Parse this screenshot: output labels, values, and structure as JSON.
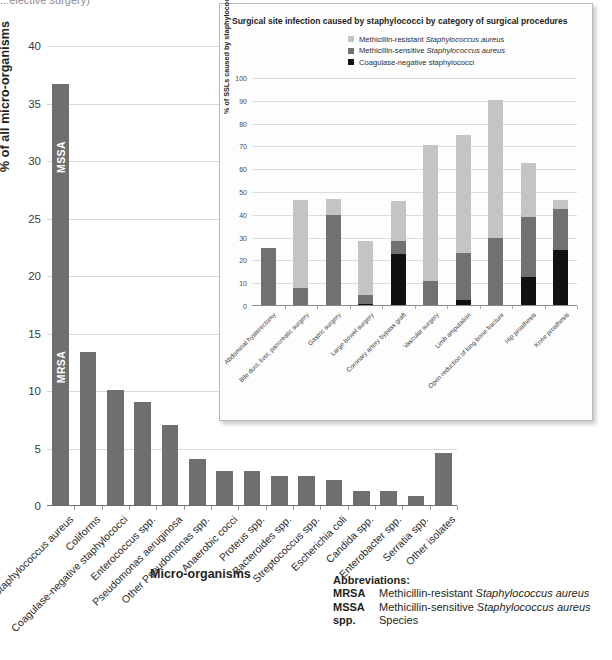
{
  "clipped_caption": "...elective surgery)",
  "main": {
    "ylabel": "% of all micro-organisms",
    "xtitle": "Micro-organisms",
    "yticks": [
      "0",
      "5",
      "10",
      "15",
      "20",
      "25",
      "30",
      "35",
      "40"
    ],
    "segment_labels": {
      "mssa": "MSSA",
      "mrsa": "MRSA"
    },
    "bar_color": "#6f6f6f"
  },
  "inset": {
    "title": "Surgical site infection caused by staphylococci by category of surgical procedures",
    "ylabel": "% of SSLs caused by staphylococci",
    "yticks": [
      "0",
      "10",
      "20",
      "30",
      "40",
      "50",
      "60",
      "70",
      "80",
      "90",
      "100"
    ],
    "legend": [
      {
        "label": "Methicillin-resistant Staphylococcus aureus",
        "plain": "Methicillin-resistant ",
        "italic": "Staphylococcus aureus",
        "color": "#c4c4c4"
      },
      {
        "label": "Methicillin-sensitive Staphylococcus aureus",
        "plain": "Methicillin-sensitive ",
        "italic": "Staphylococcus aureus",
        "color": "#717171"
      },
      {
        "label": "Coagulase-negative staphylococci",
        "plain": "Coagulase-negative staphylococci",
        "italic": "",
        "color": "#111111"
      }
    ]
  },
  "abbreviations": {
    "title": "Abbreviations:",
    "rows": [
      {
        "key": "MRSA",
        "plain": "Methicillin-resistant ",
        "italic": "Staphylococcus aureus"
      },
      {
        "key": "MSSA",
        "plain": "Methicillin-sensitive ",
        "italic": "Staphylococcus aureus"
      },
      {
        "key": "spp.",
        "plain": "Species",
        "italic": ""
      }
    ]
  },
  "chart_data": [
    {
      "type": "bar",
      "id": "main",
      "title": "",
      "xlabel": "Micro-organisms",
      "ylabel": "% of all micro-organisms",
      "ylim": [
        0,
        40
      ],
      "ytick_step": 5,
      "grid": true,
      "legend": "none",
      "bar_color": "#6f6f6f",
      "categories": [
        "Staphylococcus aureus",
        "Coliforms",
        "Coagulase-negative staphylococci",
        "Enterococcus spp.",
        "Pseudomonas aeruginosa",
        "Other Pseudomonas spp.",
        "Anaerobic cocci",
        "Proteus spp.",
        "Bacteroides spp.",
        "Streptococcus spp.",
        "Escherichia coli",
        "Candida spp.",
        "Enterobacter spp.",
        "Serratia spp.",
        "Other isolates"
      ],
      "values": [
        36.6,
        13.3,
        10.0,
        9.0,
        7.0,
        4.0,
        3.0,
        3.0,
        2.5,
        2.5,
        2.2,
        1.2,
        1.2,
        0.8,
        4.5
      ],
      "annotations": [
        {
          "category": "Staphylococcus aureus",
          "label": "MSSA",
          "from": 24.0,
          "to": 36.6
        },
        {
          "category": "Staphylococcus aureus",
          "label": "MRSA",
          "from": 0.0,
          "to": 24.0
        }
      ]
    },
    {
      "type": "bar",
      "id": "inset",
      "stacked": true,
      "title": "Surgical site infection caused by staphylococci by category of surgical procedures",
      "xlabel": "",
      "ylabel": "% of SSLs caused by staphylococci",
      "ylim": [
        0,
        100
      ],
      "ytick_step": 10,
      "grid": true,
      "legend_position": "top-right",
      "categories": [
        "Abdominal hysterectomy",
        "Bile duct, liver, pancreatic surgery",
        "Gastric surgery",
        "Large bowel surgery",
        "Coronary artery bypass graft",
        "Vascular surgery",
        "Limb amputation",
        "Open reduction of long bone fracture",
        "Hip prosthesis",
        "Knee prosthesis"
      ],
      "series": [
        {
          "name": "Coagulase-negative staphylococci",
          "color": "#111111",
          "values": [
            0.0,
            0.0,
            0.0,
            0.5,
            22.5,
            0.0,
            2.0,
            0.0,
            12.5,
            24.0
          ]
        },
        {
          "name": "Methicillin-sensitive Staphylococcus aureus",
          "color": "#717171",
          "values": [
            25.0,
            7.5,
            39.5,
            4.0,
            5.5,
            10.5,
            21.0,
            29.5,
            26.0,
            18.0
          ]
        },
        {
          "name": "Methicillin-resistant Staphylococcus aureus",
          "color": "#c4c4c4",
          "values": [
            0.0,
            38.5,
            7.0,
            23.5,
            17.5,
            59.5,
            51.5,
            60.5,
            24.0,
            4.0
          ]
        }
      ],
      "totals": [
        25.0,
        46.0,
        46.5,
        28.0,
        45.5,
        70.0,
        74.5,
        90.0,
        62.5,
        46.0
      ]
    }
  ]
}
